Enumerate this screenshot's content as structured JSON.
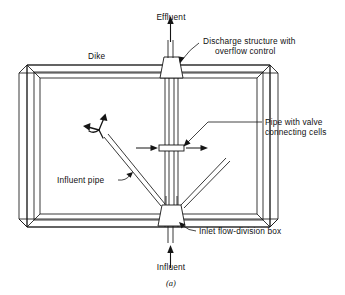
{
  "figure": {
    "caption": "(a)"
  },
  "labels": {
    "effluent": "Effluent",
    "dike": "Dike",
    "discharge_structure_line1": "Discharge structure with",
    "discharge_structure_line2": "overflow control",
    "pipe_with_valve_line1": "Pipe with valve",
    "pipe_with_valve_line2": "connecting cells",
    "influent_pipe": "Influent pipe",
    "inlet_flow_division_box": "Inlet flow-division box",
    "influent": "Influent"
  },
  "colors": {
    "background": "#ffffff",
    "ink": "#151515",
    "text": "#101010"
  },
  "icons": {
    "effluent_arrow": "arrow-up-icon",
    "influent_arrow": "arrow-up-icon",
    "flow_left_arrow": "arrow-right-icon",
    "flow_right_arrow": "arrow-right-icon",
    "distribution_arrow": "branching-flow-arrow-icon",
    "discharge_leader": "leader-line-icon",
    "valve_leader": "leader-line-icon",
    "influent_pipe_leader": "leader-line-icon",
    "inlet_box_leader": "leader-line-icon"
  }
}
